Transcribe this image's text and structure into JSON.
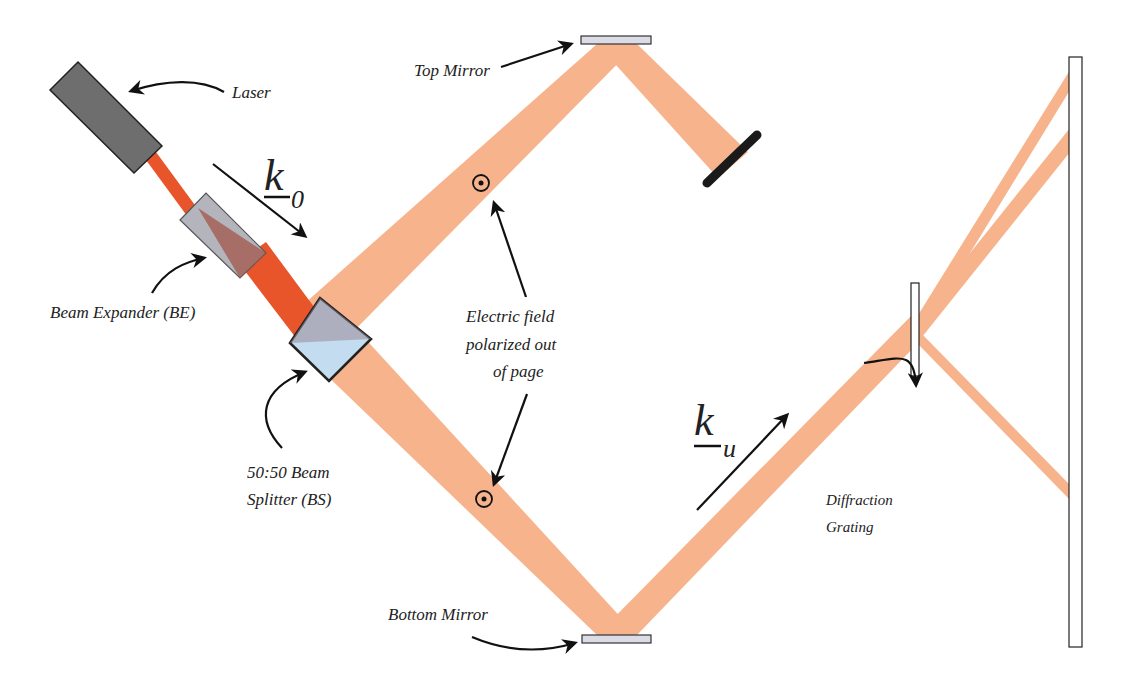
{
  "diagram": {
    "labels": {
      "laser": "Laser",
      "top_mirror": "Top Mirror",
      "beam_expander": "Beam Expander (BE)",
      "beam_splitter_line1": "50:50 Beam",
      "beam_splitter_line2": "Splitter (BS)",
      "efield_line1": "Electric field",
      "efield_line2": "polarized out",
      "efield_line3": "of page",
      "bottom_mirror": "Bottom Mirror",
      "grating_line1": "Diffraction",
      "grating_line2": "Grating",
      "k0_main": "k",
      "k0_sub": "0",
      "ku_main": "k",
      "ku_sub": "u"
    },
    "colors": {
      "laser_body": "#6e6e6e",
      "beam_intense": "#e8532a",
      "beam_split": "#f4a477",
      "mirror_fill": "#dcdce6",
      "splitter_fill": "#c4dcf0",
      "expander_fill": "#b4b4bc",
      "absorber": "#1a1a1a",
      "arrow": "#111111"
    },
    "components": [
      "laser",
      "beam-expander",
      "beam-splitter",
      "top-mirror",
      "beam-dump",
      "bottom-mirror",
      "diffraction-grating",
      "screen"
    ],
    "polarization_symbol": "out-of-page (dot in circle)"
  }
}
